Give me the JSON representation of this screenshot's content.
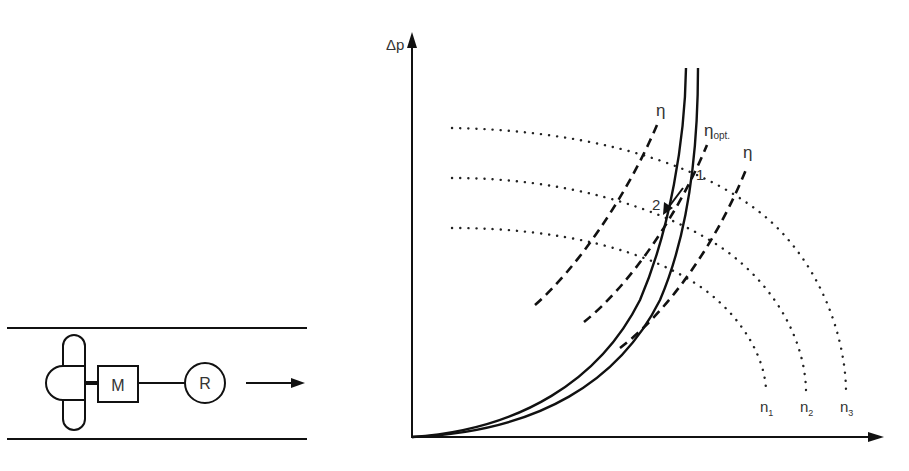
{
  "schematic": {
    "motor_label": "M",
    "regulator_label": "R",
    "flow_direction": "right-arrow"
  },
  "graph": {
    "y_axis_label": "Δp",
    "x_axis_label": "",
    "efficiency_label_left": "η",
    "efficiency_label_opt": "η",
    "efficiency_label_opt_sub": "opt.",
    "efficiency_label_right": "η",
    "speed_labels": [
      {
        "base": "n",
        "sub": "1"
      },
      {
        "base": "n",
        "sub": "2"
      },
      {
        "base": "n",
        "sub": "3"
      }
    ],
    "point_1": "1",
    "point_2": "2"
  },
  "colors": {
    "line": "#111111",
    "text": "#333333",
    "background": "#ffffff"
  }
}
